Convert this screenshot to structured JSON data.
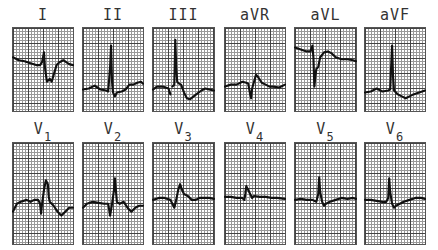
{
  "figure": {
    "rows": [
      {
        "leads": [
          {
            "label": "I",
            "sub": ""
          },
          {
            "label": "II",
            "sub": ""
          },
          {
            "label": "III",
            "sub": ""
          },
          {
            "label": "aVR",
            "sub": ""
          },
          {
            "label": "aVL",
            "sub": ""
          },
          {
            "label": "aVF",
            "sub": ""
          }
        ]
      },
      {
        "leads": [
          {
            "label": "V",
            "sub": "1"
          },
          {
            "label": "V",
            "sub": "2"
          },
          {
            "label": "V",
            "sub": "3"
          },
          {
            "label": "V",
            "sub": "4"
          },
          {
            "label": "V",
            "sub": "5"
          },
          {
            "label": "V",
            "sub": "6"
          }
        ]
      }
    ],
    "colors": {
      "trace": "#111111",
      "grid_major": "#444444",
      "grid_minor": "#999999",
      "background": "#ffffff"
    }
  }
}
